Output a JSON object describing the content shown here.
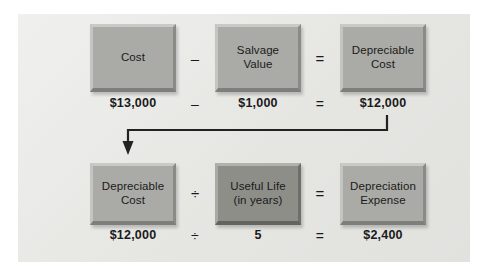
{
  "diagram": {
    "colors": {
      "panel_background": "#e9e9e6",
      "box_fill": "#aaaaa6",
      "box_fill_dark": "#8e8e89",
      "box_highlight": "#c9c9c5",
      "box_shadow": "#7e7e7a",
      "text": "#1a1a1a",
      "arrow": "#222222"
    },
    "rows": [
      {
        "id": "row-1",
        "boxes": [
          {
            "id": "cost",
            "label": "Cost",
            "shade": "light"
          },
          {
            "id": "salvage-value",
            "label": "Salvage\nValue",
            "shade": "light"
          },
          {
            "id": "depreciable-cost",
            "label": "Depreciable\nCost",
            "shade": "light"
          }
        ],
        "operators": [
          {
            "id": "minus",
            "symbol": "–"
          },
          {
            "id": "equals",
            "symbol": "="
          }
        ],
        "values": [
          {
            "id": "cost-value",
            "text": "$13,000"
          },
          {
            "id": "value-op-minus",
            "text": "–"
          },
          {
            "id": "salvage-value-value",
            "text": "$1,000"
          },
          {
            "id": "value-op-equals",
            "text": "="
          },
          {
            "id": "depreciable-cost-value",
            "text": "$12,000"
          }
        ]
      },
      {
        "id": "row-2",
        "boxes": [
          {
            "id": "depreciable-cost-2",
            "label": "Depreciable\nCost",
            "shade": "light"
          },
          {
            "id": "useful-life",
            "label": "Useful Life\n(in years)",
            "shade": "dark"
          },
          {
            "id": "depreciation-expense",
            "label": "Depreciation\nExpense",
            "shade": "light"
          }
        ],
        "operators": [
          {
            "id": "divide",
            "symbol": "÷"
          },
          {
            "id": "equals",
            "symbol": "="
          }
        ],
        "values": [
          {
            "id": "depreciable-cost-2-value",
            "text": "$12,000"
          },
          {
            "id": "value-op-divide",
            "text": "÷"
          },
          {
            "id": "useful-life-value",
            "text": "5"
          },
          {
            "id": "value-op-equals-2",
            "text": "="
          },
          {
            "id": "depreciation-expense-value",
            "text": "$2,400"
          }
        ]
      }
    ],
    "connector": {
      "id": "flow-arrow",
      "from": "depreciable-cost-value",
      "to": "depreciable-cost-2",
      "description": "elbow arrow from $12,000 down, left, then down into Depreciable Cost box"
    }
  }
}
